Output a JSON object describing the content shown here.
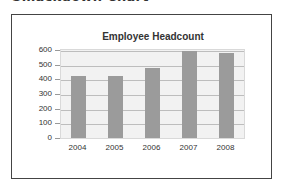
{
  "page": {
    "heading": "Smackdown Chart"
  },
  "colors": {
    "bar": "#9b9b9b",
    "plot_background": "#f2f2f2",
    "gridline": "#bdbdbd",
    "frame": "#444444"
  },
  "chart_data": {
    "type": "bar",
    "title": "Employee Headcount",
    "xlabel": "",
    "ylabel": "",
    "categories": [
      "2004",
      "2005",
      "2006",
      "2007",
      "2008"
    ],
    "values": [
      420,
      425,
      475,
      590,
      580
    ],
    "ylim": [
      0,
      600
    ],
    "yticks": [
      "0",
      "100",
      "200",
      "300",
      "400",
      "500",
      "600"
    ],
    "grid": true,
    "legend": null
  }
}
